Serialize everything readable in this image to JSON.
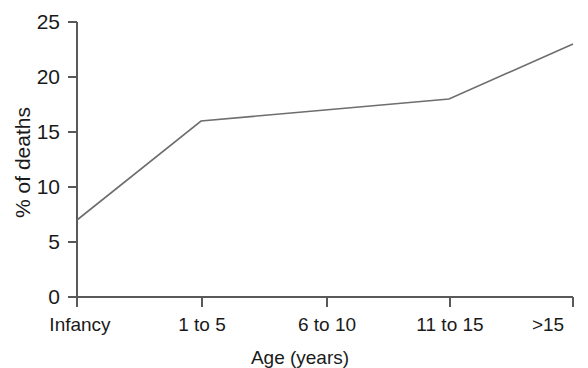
{
  "chart_data": {
    "type": "line",
    "title": "",
    "xlabel": "Age (years)",
    "ylabel": "% of deaths",
    "categories": [
      "Infancy",
      "1 to 5",
      "6 to 10",
      "11 to 15",
      ">15"
    ],
    "values": [
      7,
      16,
      17,
      18,
      23
    ],
    "series": [
      {
        "name": "% of deaths",
        "values": [
          7,
          16,
          17,
          18,
          23
        ]
      }
    ],
    "ylim": [
      0,
      25
    ],
    "yticks": [
      0,
      5,
      10,
      15,
      20,
      25
    ],
    "ytick_labels": [
      "0",
      "5",
      "10",
      "15",
      "20",
      "25"
    ],
    "grid": false,
    "legend": false,
    "legend_position": "none",
    "line_color": "#6e6e6e",
    "axis_color": "#595959",
    "background_color": "#ffffff",
    "markers": false
  }
}
